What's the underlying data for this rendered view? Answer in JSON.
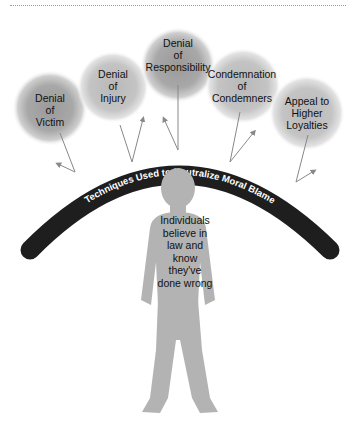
{
  "diagram": {
    "arc_label": "Techniques Used to Neutralize Moral Blame",
    "center_text": [
      "Individuals",
      "believe in",
      "law and",
      "know",
      "they've",
      "done wrong"
    ],
    "techniques": [
      {
        "id": "victim",
        "lines": [
          "Denial",
          "of",
          "Victim"
        ]
      },
      {
        "id": "injury",
        "lines": [
          "Denial",
          "of",
          "Injury"
        ]
      },
      {
        "id": "responsibility",
        "lines": [
          "Denial",
          "of",
          "Responsibility"
        ]
      },
      {
        "id": "condemners",
        "lines": [
          "Condemnation",
          "of",
          "Condemners"
        ]
      },
      {
        "id": "loyalties",
        "lines": [
          "Appeal to",
          "Higher",
          "Loyalties"
        ]
      }
    ]
  }
}
